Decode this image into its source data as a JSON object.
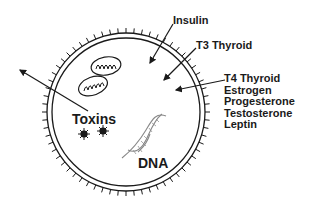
{
  "diagram": {
    "type": "cell-diagram",
    "colors": {
      "stroke": "#1a1a1a",
      "background": "#ffffff",
      "dna": "#888888"
    },
    "labels": {
      "insulin": "Insulin",
      "t3": "T3 Thyroid",
      "group": [
        "T4 Thyroid",
        "Estrogen",
        "Progesterone",
        "Testosterone",
        "Leptin"
      ],
      "toxins": "Toxins",
      "dna": "DNA"
    },
    "icons": {
      "mitochondria": "mitochondrion-icon",
      "toxin": "toxin-particle-icon",
      "dna": "dna-helix-icon"
    }
  }
}
